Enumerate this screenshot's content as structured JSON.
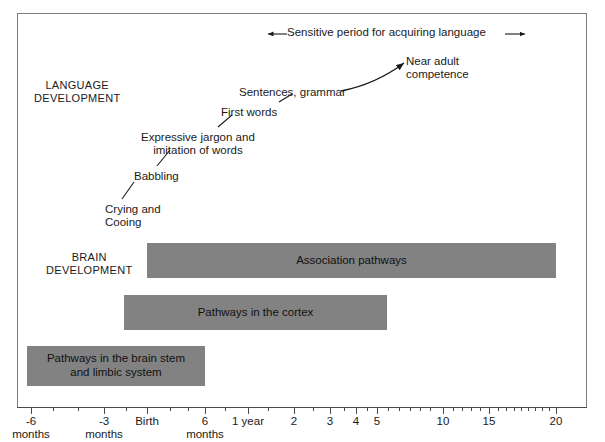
{
  "figure": {
    "sensitive_period": {
      "label": "Sensitive period for acquiring language",
      "left_arrow": "left-arrow-icon",
      "right_arrow": "right-arrow-icon"
    },
    "sections": {
      "language": "LANGUAGE\nDEVELOPMENT",
      "brain": "BRAIN\nDEVELOPMENT"
    }
  },
  "chart_data": {
    "type": "timeline",
    "xlabel": "",
    "ylabel": "",
    "axis": {
      "tick_labels": [
        "-6\nmonths",
        "-3\nmonths",
        "Birth",
        "6\nmonths",
        "1 year",
        "2",
        "3",
        "4",
        "5",
        "10",
        "15",
        "20"
      ],
      "range_start": "-6 months",
      "range_end": "20 years",
      "scale": "compressed / logarithmic-like",
      "grid": false
    },
    "milestones": [
      {
        "label": "Crying and\nCooing",
        "x": 105,
        "y": 203
      },
      {
        "label": "Babbling",
        "x": 134,
        "y": 170
      },
      {
        "label": "Expressive jargon and\nimitation of words",
        "x": 141,
        "y": 131
      },
      {
        "label": "First words",
        "x": 221,
        "y": 106
      },
      {
        "label": "Sentences, grammar",
        "x": 239,
        "y": 86
      },
      {
        "label": "Near adult\ncompetence",
        "x": 406,
        "y": 55
      }
    ],
    "bars": [
      {
        "label": "Association pathways",
        "x": 147,
        "y": 243,
        "width": 409,
        "height": 35
      },
      {
        "label": "Pathways in the cortex",
        "x": 124,
        "y": 295,
        "width": 263,
        "height": 35
      },
      {
        "label": "Pathways in the brain stem\nand limbic system",
        "x": 27,
        "y": 346,
        "width": 178,
        "height": 40
      }
    ],
    "colors": {
      "bar_fill": "#828282",
      "frame": "#7c7c7c",
      "axis": "#4a4a4a",
      "text": "#1a1a1a",
      "background": "#ffffff"
    }
  }
}
